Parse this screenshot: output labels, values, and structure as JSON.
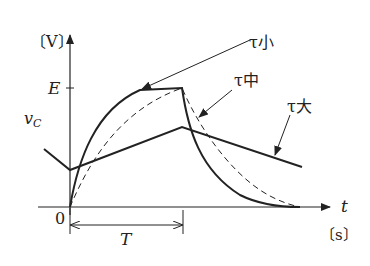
{
  "diagram": {
    "title": "",
    "y_axis": {
      "unit_label": "〔V〕",
      "tick_label": "E",
      "curve_label": "vC",
      "curve_label_sub": "C"
    },
    "x_axis": {
      "var_label": "t",
      "unit_label": "〔s〕",
      "origin_label": "0",
      "period_label": "T"
    },
    "curves": [
      {
        "name": "tau-small",
        "label": "τ小",
        "style": "solid"
      },
      {
        "name": "tau-medium",
        "label": "τ中",
        "style": "dashed"
      },
      {
        "name": "tau-large",
        "label": "τ大",
        "style": "solid"
      }
    ],
    "colors": {
      "line": "#222222",
      "background": "#ffffff"
    }
  }
}
